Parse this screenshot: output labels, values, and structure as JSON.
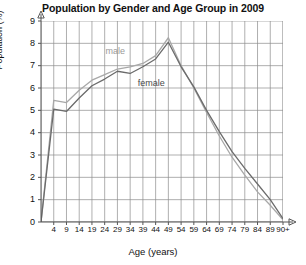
{
  "chart_data": {
    "type": "line",
    "title": "Population by Gender and Age Group in 2009",
    "xlabel": "Age (years)",
    "ylabel": "Population (%)",
    "categories": [
      "0",
      "4",
      "9",
      "14",
      "19",
      "24",
      "29",
      "34",
      "39",
      "44",
      "49",
      "54",
      "59",
      "64",
      "69",
      "74",
      "79",
      "84",
      "89",
      "90+"
    ],
    "xtick_labels": [
      "4",
      "9",
      "14",
      "19",
      "24",
      "29",
      "34",
      "39",
      "44",
      "49",
      "54",
      "59",
      "64",
      "69",
      "74",
      "79",
      "84",
      "89",
      "90+"
    ],
    "ytick_labels": [
      "0",
      "1",
      "2",
      "3",
      "4",
      "5",
      "6",
      "7",
      "8",
      "9"
    ],
    "ylim": [
      0,
      9
    ],
    "grid": true,
    "legend": "inline-annotations",
    "series": [
      {
        "name": "male",
        "color": "#a8a8a8",
        "values": [
          0.0,
          5.45,
          5.35,
          5.9,
          6.35,
          6.6,
          6.85,
          6.95,
          7.1,
          7.45,
          8.25,
          7.0,
          6.0,
          4.9,
          3.85,
          2.9,
          2.1,
          1.35,
          0.75,
          0.1
        ]
      },
      {
        "name": "female",
        "color": "#6b6b6b",
        "values": [
          0.0,
          5.05,
          4.95,
          5.55,
          6.1,
          6.4,
          6.75,
          6.65,
          6.95,
          7.3,
          8.05,
          6.95,
          6.05,
          5.0,
          4.05,
          3.15,
          2.4,
          1.7,
          1.0,
          0.15
        ]
      }
    ],
    "annotations": [
      {
        "text": "male",
        "x_index": 6,
        "value": 7.6
      },
      {
        "text": "female",
        "x_index": 9,
        "value": 6.2
      }
    ]
  }
}
